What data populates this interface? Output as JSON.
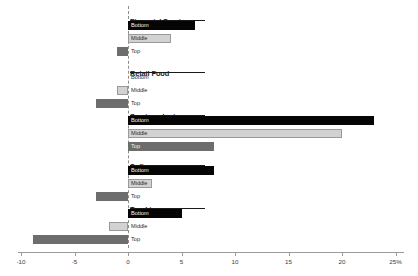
{
  "chart_data": {
    "type": "bar",
    "orientation": "horizontal",
    "title": "",
    "xlabel": "",
    "ylabel": "",
    "xlim": [
      -10,
      25
    ],
    "xticks": [
      -10,
      -5,
      0,
      5,
      10,
      15,
      20,
      25
    ],
    "xticklabels": [
      "-10",
      "-5",
      "0",
      "5",
      "10",
      "15",
      "20",
      "25%"
    ],
    "grid": false,
    "legend": "none",
    "zero_reference_line": true,
    "series": [
      {
        "name": "Bottom",
        "color": "#050505"
      },
      {
        "name": "Middle",
        "color": "#d2d2d2"
      },
      {
        "name": "Top",
        "color": "#6d6d6d"
      }
    ],
    "categories": [
      "Financial Services",
      "Retail Food",
      "Semiconductors",
      "Software",
      "Trucking"
    ],
    "groups": [
      {
        "label": "Financial Services",
        "bars": [
          {
            "series": "Bottom",
            "value": 6.3
          },
          {
            "series": "Middle",
            "value": 4.0
          },
          {
            "series": "Top",
            "value": -1.0
          }
        ]
      },
      {
        "label": "Retail Food",
        "bars": [
          {
            "series": "Bottom",
            "value": 0.0
          },
          {
            "series": "Middle",
            "value": -1.0
          },
          {
            "series": "Top",
            "value": -3.0
          }
        ]
      },
      {
        "label": "Semiconductors",
        "bars": [
          {
            "series": "Bottom",
            "value": 23.0
          },
          {
            "series": "Middle",
            "value": 20.0
          },
          {
            "series": "Top",
            "value": 8.0
          }
        ]
      },
      {
        "label": "Software",
        "bars": [
          {
            "series": "Bottom",
            "value": 8.0
          },
          {
            "series": "Middle",
            "value": 2.2
          },
          {
            "series": "Top",
            "value": -3.0
          }
        ]
      },
      {
        "label": "Trucking",
        "bars": [
          {
            "series": "Bottom",
            "value": 5.0
          },
          {
            "series": "Middle",
            "value": -1.8
          },
          {
            "series": "Top",
            "value": -8.9
          }
        ]
      }
    ]
  },
  "colors": {
    "bottom": "#050505",
    "middle": "#d2d2d2",
    "middle_border": "#9a9a9a",
    "top": "#6d6d6d",
    "axis": "#9a9a9a",
    "zero_line": "#8d8d8d",
    "text": "#1a1a1a",
    "background": "#ffffff"
  }
}
